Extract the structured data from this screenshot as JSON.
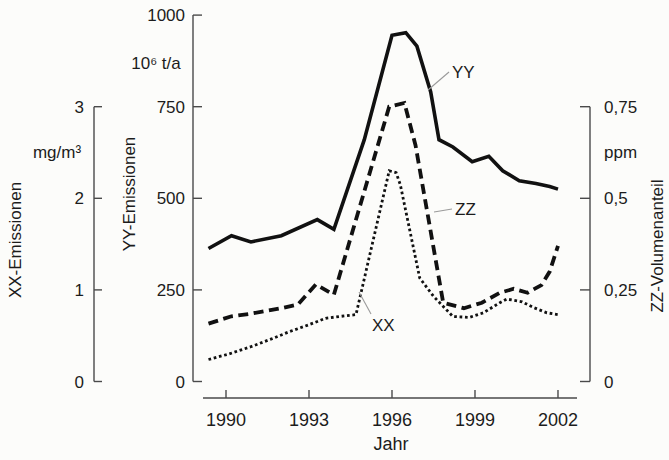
{
  "figure": {
    "background": "#fcfcfa",
    "curve_color": "#111111",
    "axis_color": "#4a4a4a",
    "leader_color": "#9a9a9a"
  },
  "chart_data": {
    "type": "line",
    "title": "",
    "x_axis": {
      "label": "Jahr",
      "ticks": [
        1990,
        1993,
        1996,
        1999,
        2002
      ],
      "tick_labels": [
        "1990",
        "1993",
        "1996",
        "1999",
        "2002"
      ],
      "range": [
        1989,
        2002.7
      ]
    },
    "axes": {
      "xx": {
        "title": "XX-Emissionen",
        "unit": "mg/m³",
        "range": [
          0,
          3
        ],
        "tick_values": [
          3,
          2,
          1,
          0
        ],
        "tick_labels": [
          "3",
          "2",
          "1",
          "0"
        ]
      },
      "yy": {
        "title": "YY-Emissionen",
        "unit": "10⁶ t/a",
        "range": [
          0,
          1000
        ],
        "tick_values": [
          1000,
          750,
          500,
          250,
          0
        ],
        "tick_labels": [
          "1000",
          "750",
          "500",
          "250",
          "0"
        ]
      },
      "zz": {
        "title": "ZZ-Volumenanteil",
        "unit": "ppm",
        "range": [
          0,
          0.75
        ],
        "tick_values": [
          0.75,
          0.5,
          0.25,
          0
        ],
        "tick_labels": [
          "0,75",
          "0,5",
          "0,25",
          "0"
        ]
      }
    },
    "series": [
      {
        "name": "YY",
        "axis": "yy",
        "style": "solid",
        "points": [
          [
            1989,
            363
          ],
          [
            1990.2,
            398
          ],
          [
            1990.9,
            381
          ],
          [
            1992.0,
            398
          ],
          [
            1993.3,
            442
          ],
          [
            1993.9,
            415
          ],
          [
            1995.0,
            660
          ],
          [
            1996.0,
            945
          ],
          [
            1996.5,
            952
          ],
          [
            1996.9,
            915
          ],
          [
            1997.4,
            790
          ],
          [
            1997.7,
            660
          ],
          [
            1998.2,
            640
          ],
          [
            1998.9,
            600
          ],
          [
            1999.5,
            615
          ],
          [
            2000.0,
            575
          ],
          [
            2000.6,
            548
          ],
          [
            2001.2,
            540
          ],
          [
            2001.7,
            532
          ],
          [
            2002,
            525
          ]
        ]
      },
      {
        "name": "ZZ",
        "axis": "zz",
        "style": "dashed",
        "points": [
          [
            1989,
            0.158
          ],
          [
            1990.2,
            0.178
          ],
          [
            1990.9,
            0.185
          ],
          [
            1992.0,
            0.2
          ],
          [
            1992.6,
            0.21
          ],
          [
            1993.25,
            0.265
          ],
          [
            1993.9,
            0.237
          ],
          [
            1995.9,
            0.75
          ],
          [
            1996.45,
            0.76
          ],
          [
            1996.85,
            0.645
          ],
          [
            1997.85,
            0.215
          ],
          [
            1998.6,
            0.2
          ],
          [
            1999.25,
            0.215
          ],
          [
            1999.9,
            0.242
          ],
          [
            2000.4,
            0.253
          ],
          [
            2000.9,
            0.242
          ],
          [
            2001.4,
            0.263
          ],
          [
            2001.7,
            0.3
          ],
          [
            2002,
            0.37
          ]
        ]
      },
      {
        "name": "XX",
        "axis": "xx",
        "style": "dotted",
        "points": [
          [
            1989,
            0.24
          ],
          [
            1990.1,
            0.3
          ],
          [
            1990.9,
            0.38
          ],
          [
            1991.6,
            0.46
          ],
          [
            1992.3,
            0.545
          ],
          [
            1993.0,
            0.62
          ],
          [
            1993.6,
            0.69
          ],
          [
            1994.1,
            0.71
          ],
          [
            1994.7,
            0.73
          ],
          [
            1995.9,
            2.3
          ],
          [
            1996.15,
            2.28
          ],
          [
            1996.3,
            2.15
          ],
          [
            1997.0,
            1.13
          ],
          [
            1997.5,
            0.93
          ],
          [
            1998.2,
            0.71
          ],
          [
            1998.8,
            0.7
          ],
          [
            1999.3,
            0.75
          ],
          [
            1999.9,
            0.86
          ],
          [
            2000.15,
            0.9
          ],
          [
            2000.7,
            0.87
          ],
          [
            2001.1,
            0.81
          ],
          [
            2001.6,
            0.75
          ],
          [
            2002,
            0.73
          ]
        ]
      }
    ],
    "series_labels": [
      {
        "text": "YY",
        "series": "YY"
      },
      {
        "text": "ZZ",
        "series": "ZZ"
      },
      {
        "text": "XX",
        "series": "XX"
      }
    ],
    "legend_position": "inline-annotations",
    "grid": false
  }
}
